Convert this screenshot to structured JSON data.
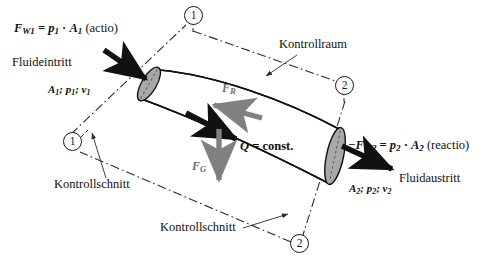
{
  "figure": {
    "colors": {
      "line": "#111111",
      "boundary": "#1a1a1a",
      "gray_arrow": "#808080",
      "black_arrow": "#111111",
      "section_fill": "#a6a6a6",
      "background": "#ffffff"
    }
  },
  "labels": {
    "force_w1": "F",
    "force_w1_sub": "W1",
    "force_w1_eq": " = ",
    "force_w1_p": "p",
    "force_w1_p_sub": "1",
    "force_w1_dot": " · ",
    "force_w1_a": "A",
    "force_w1_a_sub": "1",
    "force_w1_note": " (actio)",
    "inlet_name": "Fluideintritt",
    "inlet_props_a": "A",
    "inlet_props_a_sub": "1",
    "inlet_props_sep1": "; ",
    "inlet_props_p": "p",
    "inlet_props_p_sub": "1",
    "inlet_props_sep2": "; ",
    "inlet_props_v": "v",
    "inlet_props_v_sub": "1",
    "control_volume": "Kontrollraum",
    "control_section_left": "Kontrollschnitt",
    "control_section_bottom": "Kontrollschnitt",
    "friction_force": "F",
    "friction_force_sub": "R",
    "gravity_force": "F",
    "gravity_force_sub": "G",
    "flow_rate_q": "Q",
    "flow_rate_eq": " = const.",
    "force_w2": "−F",
    "force_w2_sub": "W2",
    "force_w2_eq": " = ",
    "force_w2_p": "p",
    "force_w2_p_sub": "2",
    "force_w2_dot": " · ",
    "force_w2_a": "A",
    "force_w2_a_sub": "2",
    "force_w2_note": " (reactio)",
    "outlet_name": "Fluidaustritt",
    "outlet_props_a": "A",
    "outlet_props_a_sub": "2",
    "outlet_props_sep1": "; ",
    "outlet_props_p": "p",
    "outlet_props_p_sub": "2",
    "outlet_props_sep2": "; ",
    "outlet_props_v": "v",
    "outlet_props_v_sub": "2"
  },
  "markers": [
    {
      "id": "top-left",
      "text": "1"
    },
    {
      "id": "right",
      "text": "2"
    },
    {
      "id": "bottom-left",
      "text": "1"
    },
    {
      "id": "bottom-right",
      "text": "2"
    }
  ]
}
